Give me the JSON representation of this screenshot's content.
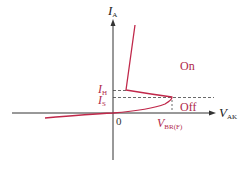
{
  "diagram": {
    "axes": {
      "y_label": "I",
      "y_label_sub": "A",
      "x_label": "V",
      "x_label_sub": "AK",
      "origin_label": "0"
    },
    "annotations": {
      "holding_current": {
        "main": "I",
        "sub": "H"
      },
      "switching_current": {
        "main": "I",
        "sub": "S"
      },
      "breakover_voltage": {
        "main": "V",
        "sub": "BR(F)"
      },
      "on_region": "On",
      "off_region": "Off"
    },
    "colors": {
      "curve": "#c0284a",
      "axis": "#333333",
      "dashed": "#444444",
      "label_red": "#b0294a"
    }
  }
}
